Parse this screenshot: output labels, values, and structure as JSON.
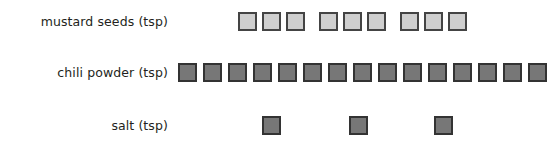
{
  "chart_data": {
    "type": "bar",
    "title": "",
    "subtitle": "",
    "xlabel": "",
    "ylabel": "",
    "legend": [],
    "grid": false,
    "unit_note": "each square icon represents 1 teaspoon",
    "categories": [
      "mustard seeds (tsp)",
      "chili powder (tsp)",
      "salt (tsp)"
    ],
    "values": [
      9,
      15,
      3
    ],
    "series": [
      {
        "name": "teaspoons",
        "values": [
          9,
          15,
          3
        ]
      }
    ],
    "rows": [
      {
        "label": "mustard seeds (tsp)",
        "count": 9,
        "icon_style": "light",
        "fill": "#cfcfcf",
        "stroke": "#444444",
        "grouped": true,
        "group_size": 3,
        "x_positions": [
          238,
          262,
          286,
          319,
          343,
          367,
          400,
          424,
          448
        ]
      },
      {
        "label": "chili powder (tsp)",
        "count": 15,
        "icon_style": "dark",
        "fill": "#777777",
        "stroke": "#333333",
        "grouped": false,
        "group_size": 0,
        "x_positions": [
          178,
          203,
          228,
          253,
          278,
          303,
          328,
          353,
          378,
          403,
          428,
          453,
          478,
          503,
          528
        ]
      },
      {
        "label": "salt (tsp)",
        "count": 3,
        "icon_style": "dark",
        "fill": "#777777",
        "stroke": "#333333",
        "grouped": false,
        "group_size": 0,
        "x_positions": [
          262,
          349,
          434
        ]
      }
    ]
  },
  "colors": {
    "background": "#ffffff",
    "text": "#231f20",
    "light_icon_fill": "#cfcfcf",
    "light_icon_stroke": "#444444",
    "dark_icon_fill": "#777777",
    "dark_icon_stroke": "#333333"
  }
}
